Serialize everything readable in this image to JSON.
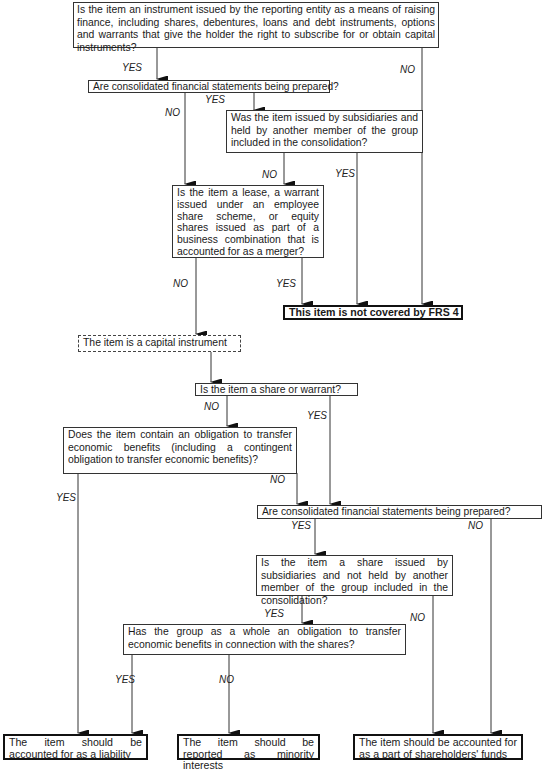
{
  "diagram": {
    "type": "decision-flowchart",
    "topic": "FRS 4 capital instruments classification",
    "nodes": {
      "q_instrument": "Is the item an instrument issued by the reporting entity as a means of raising finance, including shares, debentures, loans and debt instruments, options and warrants that give the holder the right to subscribe for or obtain capital instruments?",
      "q_consolidated_1": "Are consolidated financial statements being prepared?",
      "q_issued_by_subsidiaries": "Was the item issued by subsidiaries and held by another member of the group included in the consolidation?",
      "q_lease_warrant_merger": "Is the item a lease, a warrant issued under an employee share scheme, or equity shares issued as part of a business combination that is accounted for as a merger?",
      "r_not_covered": "This item is not covered by FRS 4",
      "s_capital_instrument": "The item is a capital instrument",
      "q_share_or_warrant": "Is the item a share or warrant?",
      "q_obligation_transfer": "Does the item contain an obligation to transfer economic benefits (including a contingent obligation to transfer economic benefits)?",
      "q_consolidated_2": "Are consolidated financial statements being prepared?",
      "q_share_by_subsidiaries": "Is the item a share issued by subsidiaries and not held by another member of the group included in the consolidation?",
      "q_group_obligation": "Has the group as a whole an obligation to transfer economic benefits in connection with the shares?",
      "r_liability": "The item should be accounted for as a liability",
      "r_minority": "The item should be reported as minority interests",
      "r_shareholders_funds": "The item should be accounted for as a part of shareholders' funds"
    },
    "labels": {
      "yes": "YES",
      "no": "NO"
    },
    "edges": [
      {
        "from": "q_instrument",
        "to": "q_consolidated_1",
        "label": "YES"
      },
      {
        "from": "q_instrument",
        "to": "r_not_covered",
        "label": "NO"
      },
      {
        "from": "q_consolidated_1",
        "to": "q_issued_by_subsidiaries",
        "label": "YES"
      },
      {
        "from": "q_consolidated_1",
        "to": "q_lease_warrant_merger",
        "label": "NO"
      },
      {
        "from": "q_issued_by_subsidiaries",
        "to": "q_lease_warrant_merger",
        "label": "NO"
      },
      {
        "from": "q_issued_by_subsidiaries",
        "to": "r_not_covered",
        "label": "YES"
      },
      {
        "from": "q_lease_warrant_merger",
        "to": "r_not_covered",
        "label": "YES"
      },
      {
        "from": "q_lease_warrant_merger",
        "to": "s_capital_instrument",
        "label": "NO"
      },
      {
        "from": "s_capital_instrument",
        "to": "q_share_or_warrant",
        "label": ""
      },
      {
        "from": "q_share_or_warrant",
        "to": "q_obligation_transfer",
        "label": "NO"
      },
      {
        "from": "q_share_or_warrant",
        "to": "q_consolidated_2",
        "label": "YES"
      },
      {
        "from": "q_obligation_transfer",
        "to": "q_consolidated_2",
        "label": "NO"
      },
      {
        "from": "q_obligation_transfer",
        "to": "r_liability",
        "label": "YES"
      },
      {
        "from": "q_consolidated_2",
        "to": "q_share_by_subsidiaries",
        "label": "YES"
      },
      {
        "from": "q_consolidated_2",
        "to": "r_shareholders_funds",
        "label": "NO"
      },
      {
        "from": "q_share_by_subsidiaries",
        "to": "q_group_obligation",
        "label": "YES"
      },
      {
        "from": "q_share_by_subsidiaries",
        "to": "r_shareholders_funds",
        "label": "NO"
      },
      {
        "from": "q_group_obligation",
        "to": "r_liability",
        "label": "YES"
      },
      {
        "from": "q_group_obligation",
        "to": "r_minority",
        "label": "NO"
      }
    ]
  }
}
